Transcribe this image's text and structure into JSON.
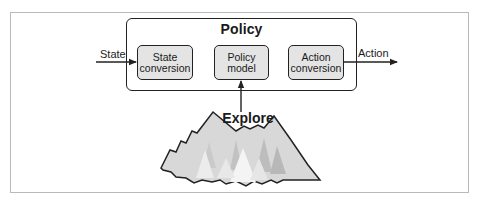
{
  "diagram": {
    "container": {
      "title": "Policy"
    },
    "input_label": "State",
    "output_label": "Action",
    "components": [
      {
        "id": "state-conversion",
        "line1": "State",
        "line2": "conversion"
      },
      {
        "id": "policy-model",
        "line1": "Policy",
        "line2": "model"
      },
      {
        "id": "action-conversion",
        "line1": "Action",
        "line2": "conversion"
      }
    ],
    "explore": {
      "label": "Explore",
      "illustration": "mountains-with-trees"
    },
    "edges": [
      {
        "from": "State",
        "to": "state-conversion"
      },
      {
        "from": "action-conversion",
        "to": "Action"
      },
      {
        "from": "Explore",
        "to": "policy-model"
      }
    ],
    "colors": {
      "stroke": "#222222",
      "box_fill": "#e4e4e4",
      "frame": "#b9b9b9",
      "mountain_fill": "#d6d6d6",
      "tree_light": "#f2f2f2",
      "tree_mid": "#bdbdbd"
    }
  }
}
